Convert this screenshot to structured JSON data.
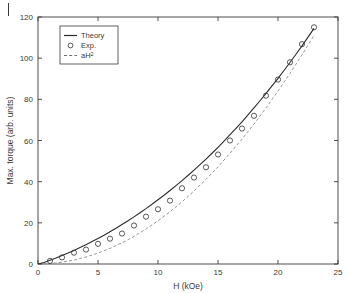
{
  "figure": {
    "artifact_mark": "page-edge-tick"
  },
  "chart_data": {
    "type": "scatter",
    "title": "",
    "xlabel": "H (kOe)",
    "ylabel": "Max. torque (arb. units)",
    "xlim": [
      0,
      25
    ],
    "ylim": [
      0,
      120
    ],
    "xticks": [
      0,
      5,
      10,
      15,
      20,
      25
    ],
    "yticks": [
      0,
      20,
      40,
      60,
      80,
      100,
      120
    ],
    "xticklabels": [
      "0",
      "5",
      "10",
      "15",
      "20",
      "25"
    ],
    "yticklabels": [
      "0",
      "20",
      "40",
      "60",
      "80",
      "100",
      "120"
    ],
    "grid": false,
    "legend_position": "upper left",
    "legend": [
      {
        "label": "Theory",
        "marker": "line-solid"
      },
      {
        "label": "Exp.",
        "marker": "circle-open"
      },
      {
        "label": "aH2",
        "marker": "line-dashed",
        "display": "aH²"
      }
    ],
    "series": [
      {
        "name": "Theory",
        "style": "solid-line",
        "color": "#2b2b2b",
        "x": [
          0,
          0.5,
          1,
          1.5,
          2,
          2.5,
          3,
          3.5,
          4,
          4.5,
          5,
          5.5,
          6,
          6.5,
          7,
          7.5,
          8,
          8.5,
          9,
          9.5,
          10,
          10.5,
          11,
          11.5,
          12,
          12.5,
          13,
          13.5,
          14,
          14.5,
          15,
          15.5,
          16,
          16.5,
          17,
          17.5,
          18,
          18.5,
          19,
          19.5,
          20,
          20.5,
          21,
          21.5,
          22,
          22.5,
          23
        ],
        "y": [
          0,
          0.7,
          1.8,
          2.9,
          4.1,
          5.3,
          6.6,
          8.0,
          9.4,
          10.9,
          12.4,
          14.0,
          15.7,
          17.4,
          19.2,
          21.0,
          22.9,
          24.9,
          26.9,
          29.0,
          31.2,
          33.4,
          35.7,
          38.1,
          40.5,
          43.0,
          45.6,
          48.3,
          51.0,
          53.8,
          56.7,
          59.7,
          62.8,
          65.9,
          69.1,
          72.4,
          75.8,
          79.3,
          82.9,
          86.5,
          90.2,
          94.0,
          97.9,
          101.9,
          106.0,
          110.2,
          114.5
        ]
      },
      {
        "name": "Exp.",
        "style": "open-circles",
        "color": "#3a3a3a",
        "x": [
          1,
          2,
          3,
          4,
          5,
          6,
          7,
          8,
          9,
          10,
          11,
          12,
          13,
          14,
          15,
          16,
          17,
          18,
          19,
          20,
          21,
          22,
          23
        ],
        "y": [
          1.5,
          3.2,
          5.5,
          7.0,
          9.8,
          12.3,
          14.8,
          18.7,
          23.0,
          26.6,
          30.8,
          36.8,
          42.0,
          47.0,
          53.2,
          60.0,
          65.8,
          72.0,
          81.8,
          89.6,
          98.0,
          106.8,
          115.0
        ]
      },
      {
        "name": "aH2",
        "style": "dashed-line",
        "color": "#8a8a8a",
        "x": [
          0,
          1,
          2,
          3,
          4,
          5,
          6,
          7,
          8,
          9,
          10,
          11,
          12,
          13,
          14,
          15,
          16,
          17,
          18,
          19,
          20,
          21,
          22,
          23
        ],
        "y": [
          0,
          0.21,
          0.84,
          1.9,
          3.4,
          5.3,
          7.6,
          10.3,
          13.4,
          17.0,
          21.0,
          25.4,
          30.2,
          35.5,
          41.1,
          47.2,
          53.8,
          60.7,
          68.0,
          75.8,
          84.0,
          92.6,
          101.6,
          111.1
        ]
      }
    ]
  }
}
